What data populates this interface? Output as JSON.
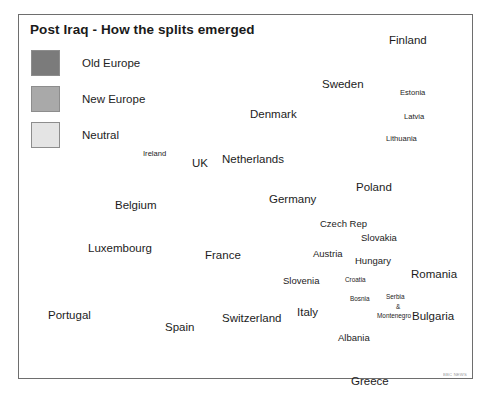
{
  "figure": {
    "title": "Post Iraq - How the splits emerged",
    "watermark": "BBC NEWS"
  },
  "legend": {
    "items": [
      {
        "label": "Old Europe",
        "color": "#7b7b7b"
      },
      {
        "label": "New Europe",
        "color": "#a9a9a9"
      },
      {
        "label": "Neutral",
        "color": "#e4e4e4"
      }
    ]
  },
  "colors": {
    "old_europe": "#7b7b7b",
    "new_europe": "#a9a9a9",
    "neutral": "#e4e4e4",
    "sea": "#ffffff",
    "outline": "#6e6e6e",
    "frame": "#6e6e6e",
    "text": "#1c1c1c"
  },
  "map": {
    "labels": [
      {
        "name": "Ireland",
        "text": "Ireland",
        "x": 143,
        "y": 150,
        "size": "sm"
      },
      {
        "name": "United Kingdom",
        "text": "UK",
        "x": 192,
        "y": 158,
        "size": "lg"
      },
      {
        "name": "Netherlands",
        "text": "Netherlands",
        "x": 222,
        "y": 154,
        "size": "lg"
      },
      {
        "name": "Belgium",
        "text": "Belgium",
        "x": 115,
        "y": 200,
        "size": "lg"
      },
      {
        "name": "Luxembourg",
        "text": "Luxembourg",
        "x": 88,
        "y": 243,
        "size": "lg"
      },
      {
        "name": "France",
        "text": "France",
        "x": 205,
        "y": 250,
        "size": "lg"
      },
      {
        "name": "Portugal",
        "text": "Portugal",
        "x": 48,
        "y": 310,
        "size": "lg"
      },
      {
        "name": "Spain",
        "text": "Spain",
        "x": 165,
        "y": 322,
        "size": "lg"
      },
      {
        "name": "Switzerland",
        "text": "Switzerland",
        "x": 222,
        "y": 313,
        "size": "lg"
      },
      {
        "name": "Germany",
        "text": "Germany",
        "x": 269,
        "y": 194,
        "size": "lg"
      },
      {
        "name": "Denmark",
        "text": "Denmark",
        "x": 250,
        "y": 109,
        "size": "lg"
      },
      {
        "name": "Sweden",
        "text": "Sweden",
        "x": 322,
        "y": 79,
        "size": "lg"
      },
      {
        "name": "Finland",
        "text": "Finland",
        "x": 389,
        "y": 35,
        "size": "lg"
      },
      {
        "name": "Estonia",
        "text": "Estonia",
        "x": 400,
        "y": 89,
        "size": "sm"
      },
      {
        "name": "Latvia",
        "text": "Latvia",
        "x": 404,
        "y": 113,
        "size": "sm"
      },
      {
        "name": "Lithuania",
        "text": "Lithuania",
        "x": 386,
        "y": 135,
        "size": "sm"
      },
      {
        "name": "Poland",
        "text": "Poland",
        "x": 356,
        "y": 182,
        "size": "lg"
      },
      {
        "name": "Czech Republic",
        "text": "Czech Rep",
        "x": 320,
        "y": 219,
        "size": "md"
      },
      {
        "name": "Slovakia",
        "text": "Slovakia",
        "x": 361,
        "y": 233,
        "size": "md"
      },
      {
        "name": "Austria",
        "text": "Austria",
        "x": 313,
        "y": 249,
        "size": "md"
      },
      {
        "name": "Hungary",
        "text": "Hungary",
        "x": 355,
        "y": 256,
        "size": "md"
      },
      {
        "name": "Romania",
        "text": "Romania",
        "x": 411,
        "y": 269,
        "size": "lg"
      },
      {
        "name": "Slovenia",
        "text": "Slovenia",
        "x": 283,
        "y": 276,
        "size": "md"
      },
      {
        "name": "Croatia",
        "text": "Croatia",
        "x": 345,
        "y": 277,
        "size": "xs"
      },
      {
        "name": "Bosnia",
        "text": "Bosnia",
        "x": 350,
        "y": 296,
        "size": "xs"
      },
      {
        "name": "Serbia",
        "text": "Serbia",
        "x": 386,
        "y": 294,
        "size": "xs"
      },
      {
        "name": "Ampersand",
        "text": "&",
        "x": 396,
        "y": 304,
        "size": "xs"
      },
      {
        "name": "Montenegro",
        "text": "Montenegro",
        "x": 377,
        "y": 313,
        "size": "xs"
      },
      {
        "name": "Italy",
        "text": "Italy",
        "x": 297,
        "y": 307,
        "size": "lg"
      },
      {
        "name": "Bulgaria",
        "text": "Bulgaria",
        "x": 412,
        "y": 311,
        "size": "lg"
      },
      {
        "name": "Albania",
        "text": "Albania",
        "x": 338,
        "y": 333,
        "size": "md"
      },
      {
        "name": "Greece",
        "text": "Greece",
        "x": 351,
        "y": 376,
        "size": "lg"
      }
    ]
  }
}
